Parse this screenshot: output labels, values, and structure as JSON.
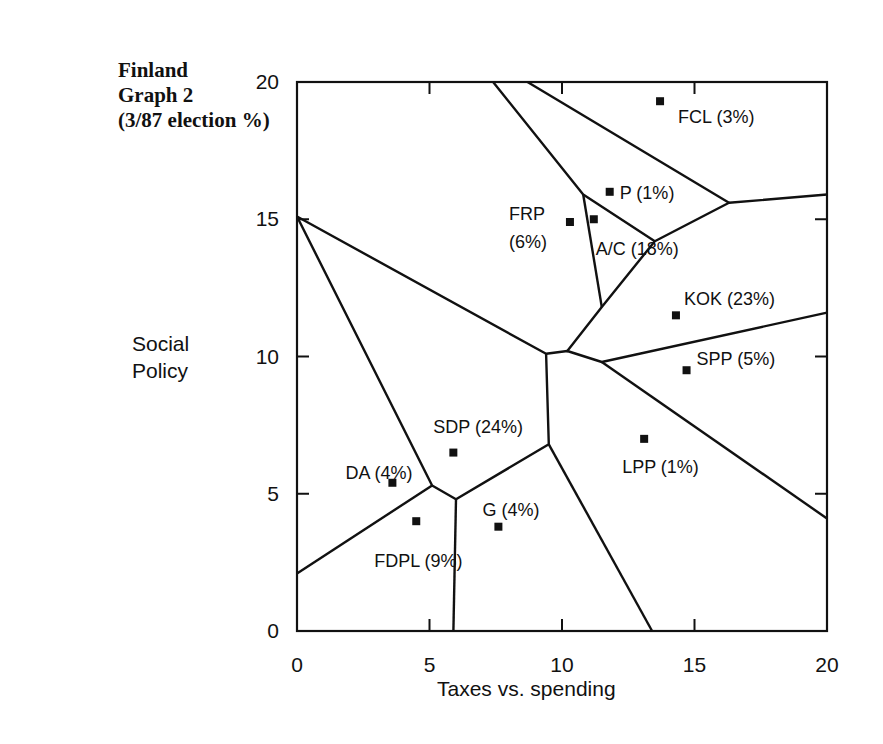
{
  "title": {
    "line1": "Finland",
    "line2": "Graph 2",
    "line3": "(3/87 election %)"
  },
  "axes": {
    "xlabel": "Taxes vs. spending",
    "ylabel_line1": "Social",
    "ylabel_line2": "Policy",
    "xticks": [
      "0",
      "5",
      "10",
      "15",
      "20"
    ],
    "yticks": [
      "0",
      "5",
      "10",
      "15",
      "20"
    ]
  },
  "chart_data": {
    "type": "scatter",
    "title": "Finland Graph 2 (3/87 election %)",
    "xlabel": "Taxes vs. spending",
    "ylabel": "Social Policy",
    "xlim": [
      0,
      20
    ],
    "ylim": [
      0,
      20
    ],
    "grid": false,
    "legend": "none",
    "annotations": "Voronoi-style boundary lines partition the plane into party regions",
    "points": [
      {
        "party": "FCL",
        "label": "FCL (3%)",
        "share": 3,
        "x": 13.7,
        "y": 19.3
      },
      {
        "party": "P",
        "label": "P (1%)",
        "share": 1,
        "x": 11.8,
        "y": 16.0
      },
      {
        "party": "FRP",
        "label": "FRP (6%)",
        "label_line1": "FRP",
        "label_line2": "(6%)",
        "share": 6,
        "x": 10.3,
        "y": 14.9
      },
      {
        "party": "A/C",
        "label": "A/C (18%)",
        "share": 18,
        "x": 11.2,
        "y": 15.0
      },
      {
        "party": "KOK",
        "label": "KOK (23%)",
        "share": 23,
        "x": 14.3,
        "y": 11.5
      },
      {
        "party": "SPP",
        "label": "SPP (5%)",
        "share": 5,
        "x": 14.7,
        "y": 9.5
      },
      {
        "party": "LPP",
        "label": "LPP (1%)",
        "share": 1,
        "x": 13.1,
        "y": 7.0
      },
      {
        "party": "SDP",
        "label": "SDP (24%)",
        "share": 24,
        "x": 5.9,
        "y": 6.5
      },
      {
        "party": "DA",
        "label": "DA (4%)",
        "share": 4,
        "x": 3.6,
        "y": 5.4
      },
      {
        "party": "FDPL",
        "label": "FDPL (9%)",
        "share": 9,
        "x": 4.5,
        "y": 4.0
      },
      {
        "party": "G",
        "label": "G (4%)",
        "share": 4,
        "x": 7.6,
        "y": 3.8
      }
    ],
    "boundaries": [
      [
        [
          7.4,
          20
        ],
        [
          10.8,
          15.9
        ],
        [
          13.5,
          14.2
        ],
        [
          16.3,
          15.6
        ],
        [
          13.5,
          14.2
        ],
        [
          11.5,
          11.8
        ],
        [
          10.2,
          10.2
        ],
        [
          11.5,
          11.8
        ]
      ],
      [
        [
          8.7,
          20
        ],
        [
          16.3,
          15.6
        ],
        [
          20,
          15.9
        ]
      ],
      [
        [
          10.8,
          15.9
        ],
        [
          11.5,
          11.8
        ]
      ],
      [
        [
          0,
          15.1
        ],
        [
          9.4,
          10.1
        ],
        [
          10.2,
          10.2
        ],
        [
          11.5,
          9.8
        ],
        [
          20,
          11.6
        ]
      ],
      [
        [
          0,
          15.1
        ],
        [
          5.1,
          5.3
        ],
        [
          6.0,
          4.8
        ],
        [
          9.5,
          6.8
        ],
        [
          9.4,
          10.1
        ]
      ],
      [
        [
          0,
          2.1
        ],
        [
          5.1,
          5.3
        ]
      ],
      [
        [
          6.0,
          4.8
        ],
        [
          5.9,
          0
        ]
      ],
      [
        [
          9.5,
          6.8
        ],
        [
          13.4,
          0
        ]
      ],
      [
        [
          11.5,
          9.8
        ],
        [
          20,
          4.1
        ]
      ]
    ]
  }
}
